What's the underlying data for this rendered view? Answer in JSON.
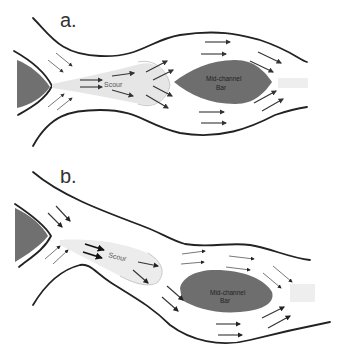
{
  "figure": {
    "panels": [
      {
        "id": "a",
        "label": "a.",
        "scour_label": "Scour",
        "bar_label_line1": "Mid-channel",
        "bar_label_line2": "Bar"
      },
      {
        "id": "b",
        "label": "b.",
        "scour_label": "Scour",
        "bar_label_line1": "Mid-channel",
        "bar_label_line2": "Bar"
      }
    ],
    "colors": {
      "bar_fill": "#6e6e6e",
      "upstream_bar_fill": "#707070",
      "scour_fill": "#e8e8e8",
      "bank_stroke": "#222222",
      "arrow_stroke": "#333333"
    },
    "icons": {
      "flow_arrow": "flow-arrow-icon"
    }
  }
}
